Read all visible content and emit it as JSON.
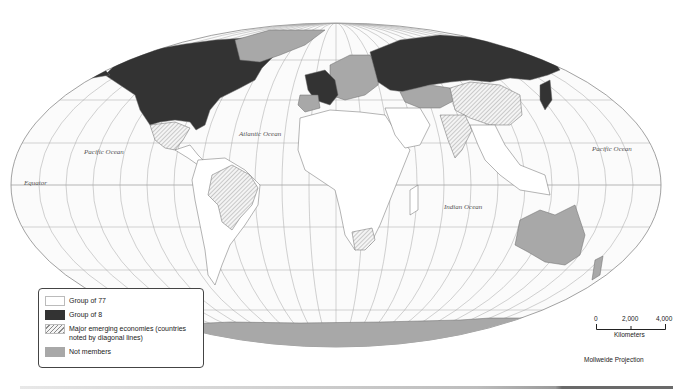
{
  "map": {
    "projection": "Mollweide Projection",
    "colors": {
      "group_of_77": "#ffffff",
      "group_of_8": "#333333",
      "emerging_hatch": "#9a9a9a",
      "not_members": "#a8a8a8",
      "graticule": "#9a9a9a",
      "border": "#777777"
    },
    "ocean_labels": {
      "pacific_west": "Pacific Ocean",
      "atlantic": "Atlantic Ocean",
      "indian": "Indian Ocean",
      "pacific_east": "Pacific Ocean",
      "equator": "Equator"
    }
  },
  "legend": {
    "items": [
      {
        "label": "Group of 77",
        "swatch": "group_of_77"
      },
      {
        "label": "Group of 8",
        "swatch": "group_of_8"
      },
      {
        "label": "Major emerging economies (countries noted by diagonal lines)",
        "swatch": "emerging_hatch"
      },
      {
        "label": "Not members",
        "swatch": "not_members"
      }
    ]
  },
  "scale": {
    "ticks": [
      "0",
      "2,000",
      "4,000"
    ],
    "unit": "Kilometers"
  }
}
